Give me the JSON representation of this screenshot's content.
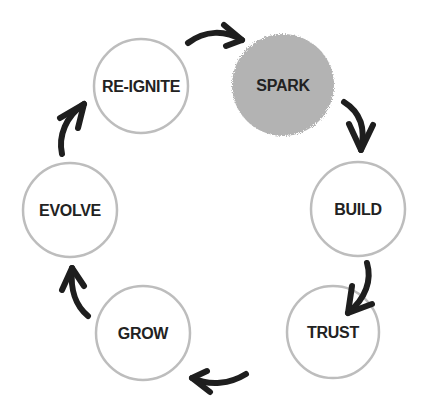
{
  "diagram": {
    "type": "cycle",
    "colors": {
      "outline": "#bdbdbd",
      "highlight_fill": "#b3b3b3",
      "arrow": "#1e1e1e",
      "text": "#222222"
    },
    "nodes": [
      {
        "id": "spark",
        "label": "SPARK",
        "highlighted": true
      },
      {
        "id": "build",
        "label": "BUILD",
        "highlighted": false
      },
      {
        "id": "trust",
        "label": "TRUST",
        "highlighted": false
      },
      {
        "id": "grow",
        "label": "GROW",
        "highlighted": false
      },
      {
        "id": "evolve",
        "label": "EVOLVE",
        "highlighted": false
      },
      {
        "id": "re-ignite",
        "label": "RE-IGNITE",
        "highlighted": false
      }
    ],
    "edges": [
      {
        "from": "re-ignite",
        "to": "spark"
      },
      {
        "from": "spark",
        "to": "build"
      },
      {
        "from": "build",
        "to": "trust"
      },
      {
        "from": "trust",
        "to": "grow"
      },
      {
        "from": "grow",
        "to": "evolve"
      },
      {
        "from": "evolve",
        "to": "re-ignite"
      }
    ]
  }
}
